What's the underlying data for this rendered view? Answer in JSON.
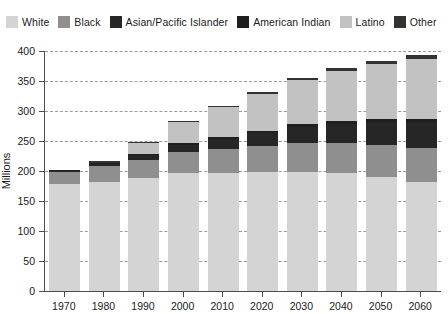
{
  "chart_data": {
    "type": "bar",
    "stacked": true,
    "title": "",
    "subtitle": "",
    "xlabel": "",
    "ylabel": "Millions",
    "ylim": [
      0,
      400
    ],
    "ytick_step": 50,
    "yticks": [
      0,
      50,
      100,
      150,
      200,
      250,
      300,
      350,
      400
    ],
    "grid": true,
    "grid_style": "dashed-horizontal",
    "legend_position": "top",
    "categories": [
      "1970",
      "1980",
      "1990",
      "2000",
      "2010",
      "2020",
      "2030",
      "2040",
      "2050",
      "2060"
    ],
    "series": [
      {
        "name": "White",
        "color": "#d4d4d4",
        "values": [
          178,
          181,
          188,
          196,
          197,
          198,
          199,
          196,
          190,
          182
        ]
      },
      {
        "name": "Black",
        "color": "#8f8f8f",
        "values": [
          21,
          27,
          30,
          36,
          39,
          43,
          47,
          50,
          53,
          56
        ]
      },
      {
        "name": "Asian/Pacific Islander",
        "color": "#262626",
        "values": [
          2,
          4,
          8,
          12,
          17,
          22,
          28,
          33,
          38,
          43
        ]
      },
      {
        "name": "American Indian",
        "color": "#1f1f1f",
        "values": [
          1,
          1,
          2,
          2,
          3,
          3,
          4,
          4,
          5,
          5
        ]
      },
      {
        "name": "Latino",
        "color": "#c2c2c2",
        "values": [
          0,
          0,
          18,
          35,
          50,
          62,
          73,
          83,
          92,
          101
        ]
      },
      {
        "name": "Other",
        "color": "#333333",
        "values": [
          0,
          4,
          2,
          3,
          3,
          3,
          4,
          5,
          6,
          7
        ]
      }
    ],
    "totals": [
      202,
      217,
      248,
      284,
      309,
      331,
      355,
      371,
      384,
      394
    ]
  },
  "legend": {
    "items": [
      {
        "label": "White",
        "color": "#d4d4d4"
      },
      {
        "label": "Black",
        "color": "#8f8f8f"
      },
      {
        "label": "Asian/Pacific Islander",
        "color": "#262626"
      },
      {
        "label": "American Indian",
        "color": "#1f1f1f"
      },
      {
        "label": "Latino",
        "color": "#c2c2c2"
      },
      {
        "label": "Other",
        "color": "#333333"
      }
    ]
  },
  "axes": {
    "y_title": "Millions",
    "y_labels": [
      "400",
      "350",
      "300",
      "250",
      "200",
      "150",
      "100",
      "50",
      "0"
    ],
    "x_labels": [
      "1970",
      "1980",
      "1990",
      "2000",
      "2010",
      "2020",
      "2030",
      "2040",
      "2050",
      "2060"
    ]
  },
  "colors": {
    "axis": "#4d4d4d",
    "grid": "#9a9a9a",
    "background": "#ffffff",
    "text": "#1a1a1a"
  }
}
